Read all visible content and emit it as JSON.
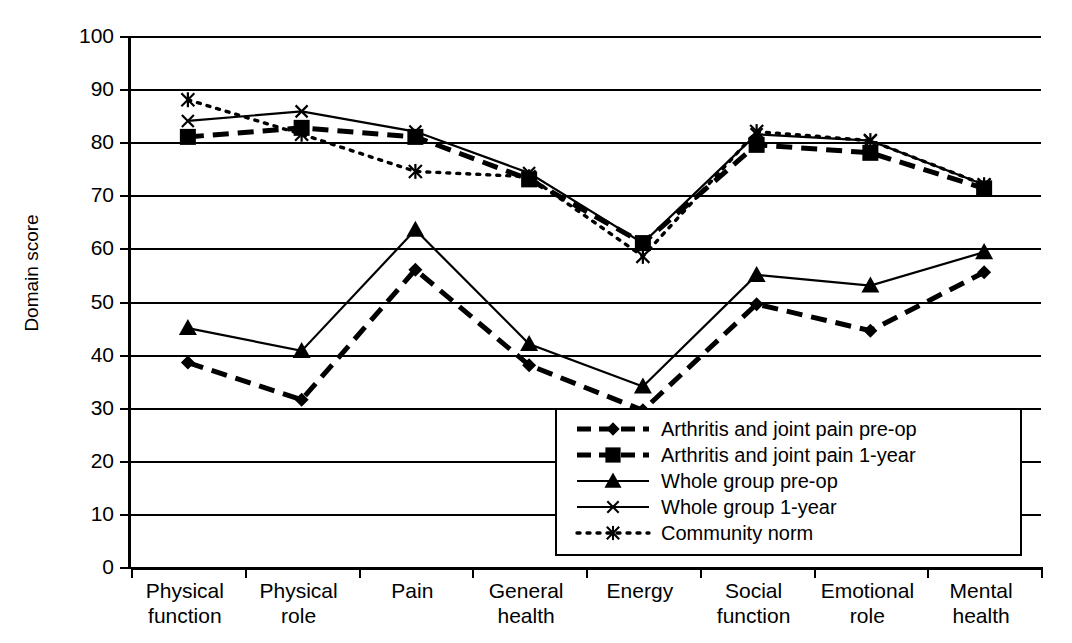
{
  "chart_data": {
    "type": "line",
    "title": "",
    "xlabel": "",
    "ylabel": "Domain score",
    "ylim": [
      0,
      100
    ],
    "ytick_step": 10,
    "grid": true,
    "legend_position": "inside-bottom-right",
    "categories": [
      "Physical function",
      "Physical role",
      "Pain",
      "General health",
      "Energy",
      "Social function",
      "Emotional role",
      "Mental health"
    ],
    "category_lines": [
      [
        "Physical",
        "function"
      ],
      [
        "Physical",
        "role"
      ],
      [
        "Pain",
        ""
      ],
      [
        "General",
        "health"
      ],
      [
        "Energy",
        ""
      ],
      [
        "Social",
        "function"
      ],
      [
        "Emotional",
        "role"
      ],
      [
        "Mental",
        "health"
      ]
    ],
    "yticks": [
      0,
      10,
      20,
      30,
      40,
      50,
      60,
      70,
      80,
      90,
      100
    ],
    "series": [
      {
        "name": "Arthritis and joint pain pre-op",
        "marker": "diamond",
        "dash": "dashed",
        "values": [
          38.5,
          31.5,
          56.0,
          38.0,
          29.5,
          49.5,
          44.5,
          55.5
        ]
      },
      {
        "name": "Arthritis and joint pain 1-year",
        "marker": "square",
        "dash": "dashed",
        "values": [
          81.0,
          82.7,
          81.0,
          73.0,
          61.0,
          79.5,
          78.0,
          71.3
        ]
      },
      {
        "name": "Whole group pre-op",
        "marker": "triangle",
        "dash": "solid",
        "values": [
          45.0,
          40.7,
          63.5,
          42.0,
          34.0,
          55.0,
          53.0,
          59.3
        ]
      },
      {
        "name": "Whole group 1-year",
        "marker": "cross",
        "dash": "solid",
        "values": [
          84.0,
          85.8,
          82.0,
          74.2,
          61.0,
          81.5,
          80.3,
          72.0
        ]
      },
      {
        "name": "Community norm",
        "marker": "star",
        "dash": "dotted",
        "values": [
          88.0,
          81.5,
          74.5,
          73.5,
          58.5,
          82.0,
          80.3,
          72.0
        ]
      }
    ],
    "colors": {
      "axis": "#000000",
      "grid": "#000000",
      "series": "#000000",
      "background": "#ffffff"
    }
  }
}
